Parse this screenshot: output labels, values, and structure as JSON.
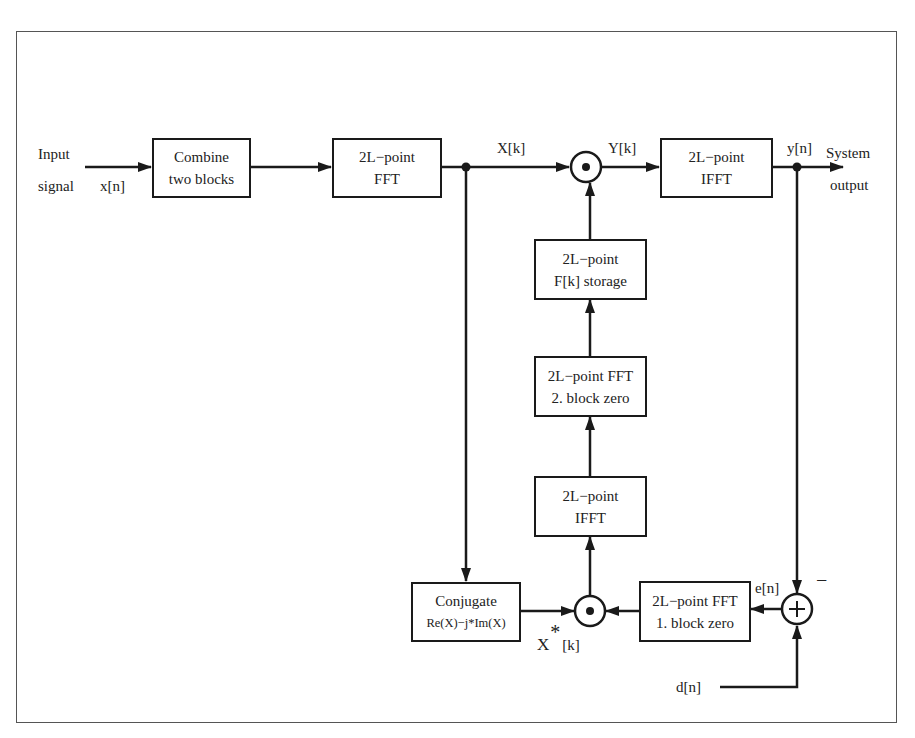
{
  "diagram": {
    "title": "",
    "blocks": {
      "combine": {
        "line1": "Combine",
        "line2": "two blocks"
      },
      "fft": {
        "line1": "2L−point",
        "line2": "FFT"
      },
      "ifft_out": {
        "line1": "2L−point",
        "line2": "IFFT"
      },
      "storage": {
        "line1": "2L−point",
        "line2": "F[k] storage"
      },
      "fft_block2": {
        "line1": "2L−point FFT",
        "line2": "2. block zero"
      },
      "ifft_mid": {
        "line1": "2L−point",
        "line2": "IFFT"
      },
      "conjugate": {
        "line1": "Conjugate",
        "line2": "Re(X)−j*Im(X)"
      },
      "fft_block1": {
        "line1": "2L−point FFT",
        "line2": "1. block zero"
      }
    },
    "labels": {
      "input_line1": "Input",
      "input_line2": "signal",
      "xn": "x[n]",
      "Xk": "X[k]",
      "Yk": "Y[k]",
      "yn": "y[n]",
      "output_line1": "System",
      "output_line2": "output",
      "en": "e[n]",
      "minus": "−",
      "dn": "d[n]",
      "Xconj_base": "X",
      "Xconj_star": "*",
      "Xconj_index": "[k]"
    },
    "operators": {
      "multiply_top": "⊙",
      "multiply_bottom": "⊙",
      "sum": "+"
    }
  }
}
